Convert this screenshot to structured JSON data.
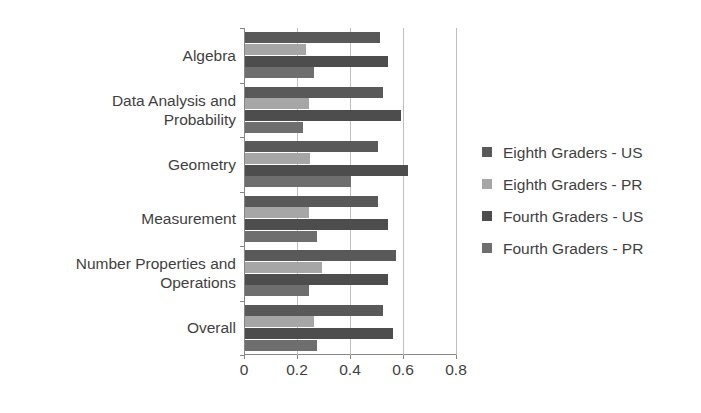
{
  "chart_data": {
    "type": "bar",
    "orientation": "horizontal",
    "title": "",
    "xlabel": "",
    "ylabel": "",
    "categories": [
      "Algebra",
      "Data Analysis and\nProbability",
      "Geometry",
      "Measurement",
      "Number Properties and\nOperations",
      "Overall"
    ],
    "series": [
      {
        "name": "Eighth Graders - US",
        "color": "#595959",
        "values": [
          0.51,
          0.52,
          0.5,
          0.5,
          0.57,
          0.52
        ]
      },
      {
        "name": "Eighth Graders - PR",
        "color": "#a6a6a6",
        "values": [
          0.23,
          0.24,
          0.245,
          0.24,
          0.29,
          0.26
        ]
      },
      {
        "name": "Fourth Graders - US",
        "color": "#4d4d4d",
        "values": [
          0.54,
          0.59,
          0.615,
          0.54,
          0.54,
          0.56
        ]
      },
      {
        "name": "Fourth Graders - PR",
        "color": "#6e6e6e",
        "values": [
          0.26,
          0.22,
          0.4,
          0.27,
          0.24,
          0.27
        ]
      }
    ],
    "xlim": [
      0,
      0.8
    ],
    "xticks": [
      "0",
      "0.2",
      "0.4",
      "0.6",
      "0.8"
    ],
    "xtick_values": [
      0,
      0.2,
      0.4,
      0.6,
      0.8
    ],
    "grid": "vertical",
    "legend_position": "right"
  },
  "legend": {
    "items": [
      {
        "label": "Eighth Graders - US",
        "color": "#595959"
      },
      {
        "label": "Eighth Graders - PR",
        "color": "#a6a6a6"
      },
      {
        "label": "Fourth Graders - US",
        "color": "#4d4d4d"
      },
      {
        "label": "Fourth Graders - PR",
        "color": "#6e6e6e"
      }
    ]
  }
}
